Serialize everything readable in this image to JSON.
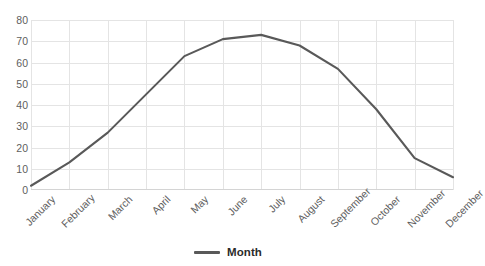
{
  "chart_data": {
    "type": "line",
    "title": "",
    "xlabel": "",
    "ylabel": "",
    "categories": [
      "January",
      "February",
      "March",
      "April",
      "May",
      "June",
      "July",
      "August",
      "September",
      "October",
      "November",
      "December"
    ],
    "series": [
      {
        "name": "Month",
        "values": [
          2,
          13,
          27,
          45,
          63,
          71,
          73,
          68,
          57,
          38,
          15,
          6
        ],
        "color": "#595959"
      }
    ],
    "ylim": [
      0,
      80
    ],
    "yticks": [
      0,
      10,
      20,
      30,
      40,
      50,
      60,
      70,
      80
    ],
    "grid": true,
    "grid_color": "#e4e4e4",
    "legend_position": "bottom"
  },
  "legend": {
    "entries": [
      {
        "label": "Month",
        "color": "#595959",
        "marker": "line-swatch"
      }
    ]
  },
  "axes": {
    "y_tick_labels": [
      "80",
      "70",
      "60",
      "50",
      "40",
      "30",
      "20",
      "10",
      "0"
    ],
    "x_tick_labels": [
      "January",
      "February",
      "March",
      "April",
      "May",
      "June",
      "July",
      "August",
      "September",
      "October",
      "November",
      "December"
    ]
  },
  "title_fragment": ""
}
